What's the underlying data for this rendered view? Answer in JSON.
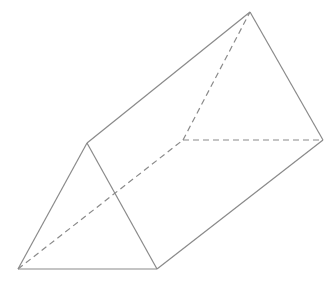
{
  "diagram": {
    "type": "triangular-prism",
    "stroke_color": "#8a8a8a",
    "background": "#ffffff",
    "vertices": {
      "A": [
        18,
        269
      ],
      "B": [
        157,
        269
      ],
      "C": [
        87,
        143
      ],
      "D": [
        250,
        12
      ],
      "E": [
        323,
        140
      ],
      "F": [
        183,
        140
      ]
    },
    "visible_edges": [
      [
        "A",
        "B"
      ],
      [
        "B",
        "C"
      ],
      [
        "C",
        "A"
      ],
      [
        "C",
        "D"
      ],
      [
        "D",
        "E"
      ],
      [
        "B",
        "E"
      ]
    ],
    "hidden_edges": [
      [
        "A",
        "F"
      ],
      [
        "F",
        "D"
      ],
      [
        "F",
        "E"
      ]
    ]
  }
}
